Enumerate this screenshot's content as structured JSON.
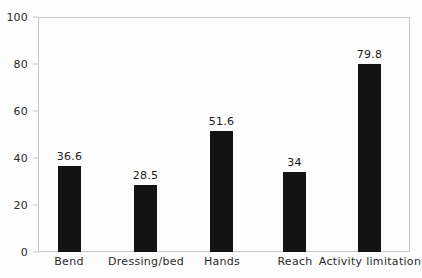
{
  "chart_data": {
    "type": "bar",
    "title": "",
    "subtitle": "",
    "xlabel": "",
    "ylabel": "",
    "categories": [
      "Bend",
      "Dressing/bed",
      "Hands",
      "Reach",
      "Activity limitation"
    ],
    "values": [
      36.6,
      28.5,
      51.6,
      34,
      79.8
    ],
    "value_labels": [
      "36.6",
      "28.5",
      "51.6",
      "34",
      "79.8"
    ],
    "ylim": [
      0,
      100
    ],
    "yticks": [
      0,
      20,
      40,
      60,
      80,
      100
    ],
    "ytick_labels": [
      "0",
      "20",
      "40",
      "60",
      "80",
      "100"
    ],
    "grid": false,
    "legend": false,
    "legend_position": "none",
    "bar_color": "#131313",
    "frame_color": "#c9c9c9",
    "background_color": "#fdfdfd"
  }
}
